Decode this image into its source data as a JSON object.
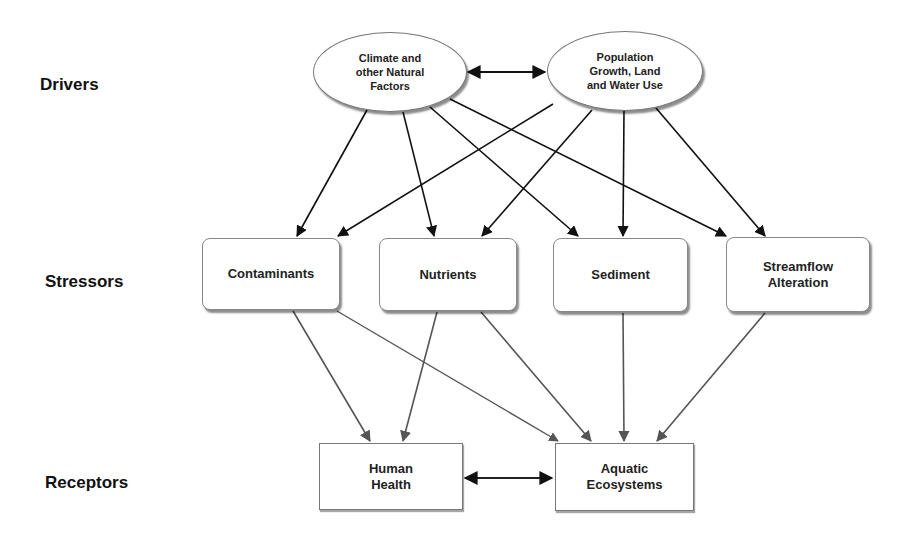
{
  "rows": {
    "drivers": "Drivers",
    "stressors": "Stressors",
    "receptors": "Receptors"
  },
  "nodes": {
    "climate": "Climate and\nother Natural\nFactors",
    "population": "Population\nGrowth, Land\nand Water Use",
    "contaminants": "Contaminants",
    "nutrients": "Nutrients",
    "sediment": "Sediment",
    "streamflow": "Streamflow\nAlteration",
    "human_health": "Human\nHealth",
    "aquatic": "Aquatic\nEcosystems"
  },
  "edges": [
    {
      "from": "climate",
      "to": "population",
      "type": "bidirectional"
    },
    {
      "from": "climate",
      "to": "contaminants"
    },
    {
      "from": "climate",
      "to": "nutrients"
    },
    {
      "from": "climate",
      "to": "sediment"
    },
    {
      "from": "climate",
      "to": "streamflow"
    },
    {
      "from": "population",
      "to": "contaminants"
    },
    {
      "from": "population",
      "to": "nutrients"
    },
    {
      "from": "population",
      "to": "sediment"
    },
    {
      "from": "population",
      "to": "streamflow"
    },
    {
      "from": "contaminants",
      "to": "human_health"
    },
    {
      "from": "contaminants",
      "to": "aquatic"
    },
    {
      "from": "nutrients",
      "to": "human_health"
    },
    {
      "from": "nutrients",
      "to": "aquatic"
    },
    {
      "from": "sediment",
      "to": "aquatic"
    },
    {
      "from": "streamflow",
      "to": "aquatic"
    },
    {
      "from": "human_health",
      "to": "aquatic",
      "type": "bidirectional"
    }
  ],
  "colors": {
    "upper_arrows": "#111111",
    "lower_arrows": "#555555"
  }
}
